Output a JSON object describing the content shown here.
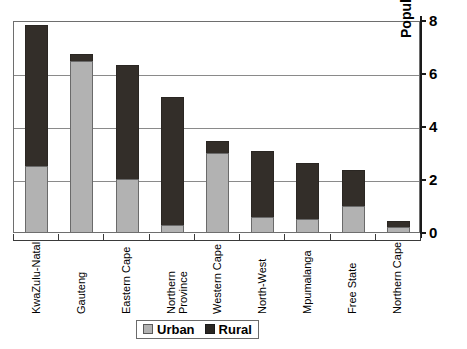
{
  "chart_data": {
    "type": "bar",
    "subtype": "stacked-vertical",
    "title": "",
    "xlabel": "",
    "ylabel": "Population (millions)",
    "ylim": [
      0,
      8
    ],
    "yticks": [
      0,
      2,
      4,
      6,
      8
    ],
    "ytick_labels": [
      "0",
      "2",
      "4",
      "6",
      "8"
    ],
    "grid": "horizontal",
    "legend_position": "bottom-center",
    "y_axis_side": "right",
    "categories": [
      "KwaZulu-Natal",
      "Gauteng",
      "Eastern Cape",
      "Northern Province",
      "Western Cape",
      "North-West",
      "Mpumalanga",
      "Free State",
      "Northern Cape"
    ],
    "series": [
      {
        "name": "Urban",
        "color": "#b2b2b2",
        "values": [
          2.5,
          6.45,
          2.0,
          0.25,
          3.0,
          0.55,
          0.5,
          1.0,
          0.2
        ]
      },
      {
        "name": "Rural",
        "color": "#332e29",
        "values": [
          5.3,
          0.25,
          4.3,
          4.85,
          0.45,
          2.5,
          2.1,
          1.35,
          0.22
        ]
      }
    ],
    "totals": [
      7.8,
      6.7,
      6.3,
      5.1,
      3.45,
      3.05,
      2.6,
      2.35,
      0.42
    ]
  },
  "axis": {
    "y_title": "Population (millions)",
    "y_tick_labels": [
      "8",
      "6",
      "4",
      "2",
      "0"
    ]
  },
  "x_labels": [
    {
      "text": "KwaZulu-Natal",
      "lines": [
        "KwaZulu-Natal"
      ]
    },
    {
      "text": "Gauteng",
      "lines": [
        "Gauteng"
      ]
    },
    {
      "text": "Eastern Cape",
      "lines": [
        "Eastern Cape"
      ]
    },
    {
      "text": "Northern Province",
      "lines": [
        "Northern",
        "Province"
      ]
    },
    {
      "text": "Western Cape",
      "lines": [
        "Western Cape"
      ]
    },
    {
      "text": "North-West",
      "lines": [
        "North-West"
      ]
    },
    {
      "text": "Mpumalanga",
      "lines": [
        "Mpumalanga"
      ]
    },
    {
      "text": "Free State",
      "lines": [
        "Free State"
      ]
    },
    {
      "text": "Northern Cape",
      "lines": [
        "Northern Cape"
      ]
    }
  ],
  "x_label_line1": {
    "0": "KwaZulu-Natal",
    "1": "Gauteng",
    "2": "Eastern Cape",
    "3": "Northern",
    "4": "Western Cape",
    "5": "North-West",
    "6": "Mpumalanga",
    "7": "Free State",
    "8": "Northern Cape"
  },
  "x_label_line2": {
    "3": "Province"
  },
  "legend": {
    "items": [
      {
        "label": "Urban",
        "color": "#b2b2b2"
      },
      {
        "label": "Rural",
        "color": "#332e29"
      }
    ]
  },
  "colors": {
    "urban": "#b2b2b2",
    "rural": "#332e29",
    "grid": "#8a8a8a",
    "axis": "#1a1a1a",
    "background": "#ffffff"
  }
}
